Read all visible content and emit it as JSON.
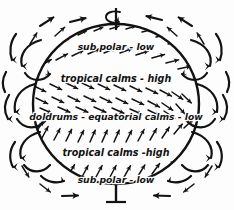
{
  "figure": {
    "kind": "global-atmospheric-circulation-diagram",
    "style": "hand-drawn-ink-illustration",
    "background_color": "#fdfdfd",
    "ink_color": "#121212"
  },
  "globe": {
    "name": "earth-globe",
    "center_x": 116,
    "center_y": 104,
    "radius_x": 84,
    "radius_y": 81,
    "outline_color": "#121212"
  },
  "axis": {
    "name": "rotation-axis",
    "top_y": 8,
    "bottom_y": 202,
    "x": 116,
    "rotation_arrow": "counterclockwise-spin-arrow"
  },
  "zones": [
    {
      "id": "sub-polar-north",
      "label": "sub polar - low",
      "pressure": "low",
      "y": 47,
      "font_size": 9.2
    },
    {
      "id": "tropical-calms-north",
      "label": "tropical calms - high",
      "pressure": "high",
      "y": 79,
      "font_size": 9.6
    },
    {
      "id": "doldrums-equator",
      "label": "doldrums - equatorial calms - low",
      "pressure": "low",
      "y": 117,
      "font_size": 9.2
    },
    {
      "id": "tropical-calms-south",
      "label": "tropical calms -high",
      "pressure": "high",
      "y": 153,
      "font_size": 9.6
    },
    {
      "id": "sub-polar-south",
      "label": "sub polar - low",
      "pressure": "low",
      "y": 180,
      "font_size": 9.2
    }
  ],
  "wind_bands": [
    {
      "id": "polar-easterlies-north",
      "band_top": 30,
      "band_bottom": 42,
      "direction_deg": -28,
      "arrow_count": 9,
      "hemisphere": "north"
    },
    {
      "id": "westerlies-north",
      "band_top": 57,
      "band_bottom": 72,
      "direction_deg": -22,
      "arrow_count": 11,
      "hemisphere": "north"
    },
    {
      "id": "trade-winds-north",
      "band_top": 87,
      "band_bottom": 108,
      "direction_deg": 26,
      "arrow_count": 13,
      "hemisphere": "north"
    },
    {
      "id": "trade-winds-south",
      "band_top": 126,
      "band_bottom": 144,
      "direction_deg": -62,
      "arrow_count": 13,
      "hemisphere": "south"
    },
    {
      "id": "westerlies-south",
      "band_top": 160,
      "band_bottom": 173,
      "direction_deg": -58,
      "arrow_count": 11,
      "hemisphere": "south"
    },
    {
      "id": "polar-easterlies-south",
      "band_top": 186,
      "band_bottom": 193,
      "direction_deg": -80,
      "arrow_count": 9,
      "hemisphere": "south"
    }
  ],
  "circulation_cells": [
    {
      "id": "cell-left-upper",
      "side": "left",
      "cx": 29,
      "cy": 60
    },
    {
      "id": "cell-left-mid",
      "side": "left",
      "cx": 20,
      "cy": 104
    },
    {
      "id": "cell-left-lower",
      "side": "left",
      "cx": 29,
      "cy": 150
    },
    {
      "id": "cell-right-upper",
      "side": "right",
      "cx": 203,
      "cy": 60
    },
    {
      "id": "cell-right-mid",
      "side": "right",
      "cx": 212,
      "cy": 104
    },
    {
      "id": "cell-right-lower",
      "side": "right",
      "cx": 203,
      "cy": 150
    }
  ],
  "outer_arrows": {
    "top_converging": 6,
    "bottom_converging": 6,
    "description": "arrows converge toward both poles from each side"
  }
}
